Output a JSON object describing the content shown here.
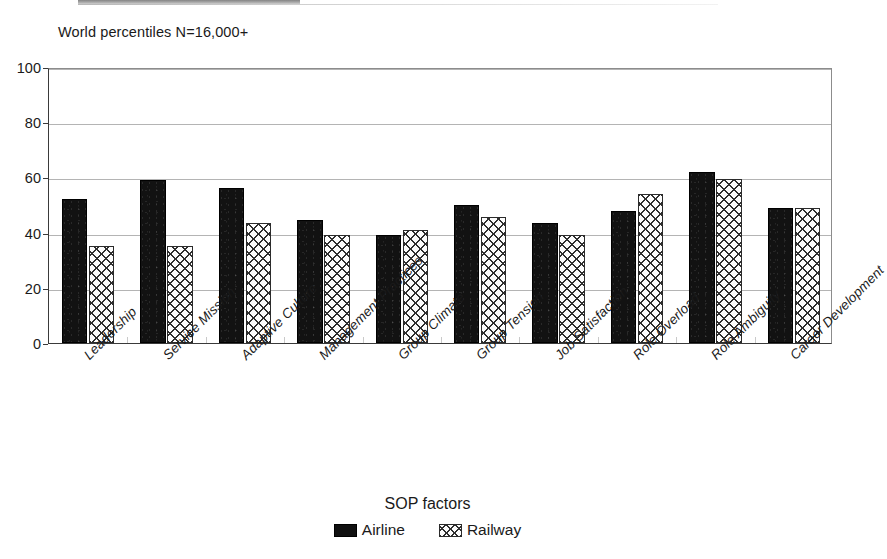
{
  "chart_data": {
    "type": "bar",
    "title": "World percentiles N=16,000+",
    "xlabel": "SOP factors",
    "ylabel": "",
    "ylim": [
      0,
      100
    ],
    "yticks": [
      0,
      20,
      40,
      60,
      80,
      100
    ],
    "grid": true,
    "legend_position": "bottom",
    "categories": [
      "Leadership",
      "Service Mission",
      "Adaptive Culture",
      "Management Practices",
      "Group Climate",
      "Group Tension",
      "Job Satisfaction",
      "Role Overload",
      "Role Ambiguity",
      "Career Development"
    ],
    "series": [
      {
        "name": "Airline",
        "fill": "solid-black",
        "color": "#121212",
        "values": [
          52,
          59,
          56,
          44.5,
          39,
          50,
          43.5,
          48,
          62,
          49
        ]
      },
      {
        "name": "Railway",
        "fill": "crosshatch",
        "color": "#2f2f2f",
        "values": [
          35,
          35,
          43.5,
          39,
          41,
          45.5,
          39,
          54,
          59.5,
          49
        ]
      }
    ]
  },
  "axis": {
    "y_tick_labels": [
      "100",
      "80",
      "60",
      "40",
      "20",
      "0"
    ]
  },
  "legend": {
    "items": [
      {
        "label": "Airline"
      },
      {
        "label": "Railway"
      }
    ]
  }
}
